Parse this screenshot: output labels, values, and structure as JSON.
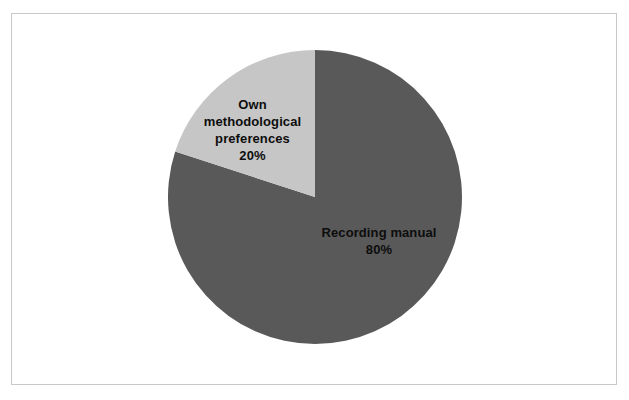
{
  "figure": {
    "background_color": "#ffffff",
    "frame_color": "#c9c9c9"
  },
  "chart_data": {
    "type": "pie",
    "title": "",
    "xlabel": "",
    "ylabel": "",
    "legend_position": "none",
    "grid": false,
    "start_angle_deg": 0,
    "direction": "clockwise",
    "categories": [
      "Recording manual",
      "Own methodological preferences"
    ],
    "values": [
      80,
      20
    ],
    "value_unit": "%",
    "colors": [
      "#595959",
      "#c6c6c6"
    ],
    "slices": [
      {
        "label": "Recording manual",
        "value": 80,
        "percent_text": "80%",
        "color": "#595959",
        "label_lines": [
          "Recording manual",
          "80%"
        ],
        "label_color": "#0d0d0d"
      },
      {
        "label": "Own methodological preferences",
        "value": 20,
        "percent_text": "20%",
        "color": "#c6c6c6",
        "label_lines": [
          "Own",
          "methodological",
          "preferences",
          "20%"
        ],
        "label_color": "#0d0d0d"
      }
    ]
  }
}
